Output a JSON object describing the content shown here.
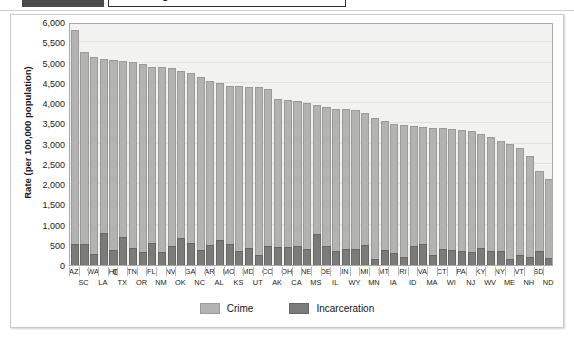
{
  "header": {
    "title": "Controlling Crime",
    "dark_block": "",
    "divider": ""
  },
  "legend": {
    "position": "bottom-center",
    "items": [
      {
        "label": "Crime",
        "color": "#b3b3b1",
        "swatch": "crime"
      },
      {
        "label": "Incarceration",
        "color": "#7b7b79",
        "swatch": "incarceration"
      }
    ]
  },
  "chart_data": {
    "type": "bar",
    "title": "",
    "subtitle": "",
    "xlabel": "",
    "ylabel": "Rate (per 100,000 population)",
    "ylim": [
      0,
      6000
    ],
    "ytick_step": 500,
    "ytick_labels": [
      "6,000",
      "5,500",
      "5,000",
      "4,500",
      "4,000",
      "3,500",
      "3,000",
      "2,500",
      "2,000",
      "1,500",
      "1,000",
      "500",
      "0"
    ],
    "ytick_values": [
      6000,
      5500,
      5000,
      4500,
      4000,
      3500,
      3000,
      2500,
      2000,
      1500,
      1000,
      500,
      0
    ],
    "grid": true,
    "grid_axis": "y",
    "legend_position": "bottom",
    "bar_style": "overlaid",
    "categories": [
      "AZ",
      "SC",
      "WA",
      "LA",
      "HI",
      "TX",
      "TN",
      "OR",
      "FL",
      "NM",
      "NV",
      "OK",
      "GA",
      "NC",
      "AR",
      "AL",
      "MO",
      "KS",
      "MD",
      "UT",
      "CO",
      "AK",
      "OH",
      "CA",
      "NE",
      "MS",
      "DE",
      "IL",
      "IN",
      "WY",
      "MI",
      "MN",
      "MT",
      "IA",
      "RI",
      "ID",
      "VA",
      "MA",
      "CT",
      "WI",
      "PA",
      "NJ",
      "KY",
      "WV",
      "NY",
      "ME",
      "VT",
      "NH",
      "SD",
      "ND"
    ],
    "series": [
      {
        "name": "Crime",
        "color": "#b3b3b1",
        "values": [
          5800,
          5250,
          5130,
          5080,
          5070,
          5040,
          5020,
          4970,
          4900,
          4880,
          4860,
          4790,
          4750,
          4650,
          4550,
          4490,
          4430,
          4420,
          4400,
          4390,
          4340,
          4090,
          4080,
          4060,
          4010,
          3950,
          3900,
          3860,
          3840,
          3830,
          3750,
          3620,
          3560,
          3480,
          3450,
          3440,
          3400,
          3390,
          3380,
          3360,
          3340,
          3320,
          3240,
          3150,
          3050,
          2980,
          2880,
          2680,
          2330,
          2130
        ]
      },
      {
        "name": "Incarceration",
        "color": "#7b7b79",
        "values": [
          520,
          530,
          270,
          800,
          360,
          700,
          430,
          310,
          550,
          310,
          480,
          670,
          540,
          360,
          490,
          610,
          530,
          340,
          420,
          250,
          470,
          440,
          440,
          470,
          400,
          760,
          480,
          350,
          400,
          400,
          490,
          160,
          370,
          290,
          190,
          460,
          510,
          250,
          400,
          380,
          340,
          320,
          420,
          340,
          340,
          150,
          250,
          190,
          350,
          170
        ]
      }
    ]
  }
}
